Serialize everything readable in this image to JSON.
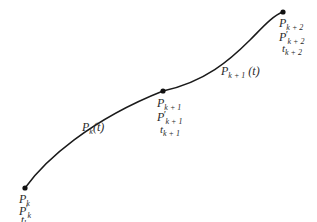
{
  "diagram": {
    "type": "piecewise-curve",
    "stroke_color": "#1a1a1a",
    "background": "#ffffff",
    "points": [
      {
        "id": "k",
        "position": [
          25,
          188
        ],
        "labels": {
          "point": "P",
          "point_sub": "k",
          "tangent": "P",
          "tangent_sub": "k",
          "param": "t",
          "param_sub": "k"
        }
      },
      {
        "id": "k+1",
        "position": [
          163,
          91
        ],
        "labels": {
          "point": "P",
          "point_sub": "k + 1",
          "tangent": "P",
          "tangent_sub": "k + 1",
          "param": "t",
          "param_sub": "k + 1"
        }
      },
      {
        "id": "k+2",
        "position": [
          283,
          12
        ],
        "labels": {
          "point": "P",
          "point_sub": "k + 2",
          "tangent": "P",
          "tangent_sub": "k + 2",
          "param": "t",
          "param_sub": "k + 2"
        }
      }
    ],
    "segments": [
      {
        "id": "seg-k",
        "label": "P",
        "label_sub": "k",
        "label_arg": "(t)"
      },
      {
        "id": "seg-k1",
        "label": "P",
        "label_sub": "k + 1",
        "label_arg": " (t)"
      }
    ],
    "prime_glyph": "′"
  }
}
